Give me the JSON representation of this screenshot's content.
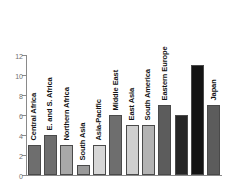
{
  "chart_data": {
    "type": "bar",
    "title": "",
    "subtitle": "",
    "xlabel": "",
    "ylabel": "",
    "ylim": [
      0,
      12
    ],
    "yticks": [
      0,
      2,
      4,
      6,
      8,
      10,
      12
    ],
    "grid": false,
    "legend": null,
    "orientation": "vertical",
    "bar_label_rotation": -90,
    "categories": [
      "Central Africa",
      "E. and S. Africa",
      "Northern Africa",
      "South Asia",
      "Asia-Pacific",
      "Middle East",
      "East Asia",
      "South America",
      "Eastern Europe",
      "North America",
      "Western Europe",
      "Japan"
    ],
    "values": [
      3,
      4,
      3,
      1,
      3,
      6,
      5,
      5,
      7,
      6,
      11,
      7
    ],
    "bar_colors": [
      "#6e6e6e",
      "#6e6e6e",
      "#a8a8a8",
      "#9a9a9a",
      "#d6d6d6",
      "#6e6e6e",
      "#cfcfcf",
      "#b3b3b3",
      "#5c5c5c",
      "#262626",
      "#141414",
      "#5c5c5c"
    ],
    "label_inverted": [
      false,
      false,
      false,
      false,
      false,
      false,
      false,
      false,
      false,
      true,
      true,
      false
    ],
    "axis_color": "#8a8a8a",
    "tick_label_color": "#6f6f6f",
    "bar_edge_color": "#4a4a4a",
    "background_color": "#ffffff"
  }
}
